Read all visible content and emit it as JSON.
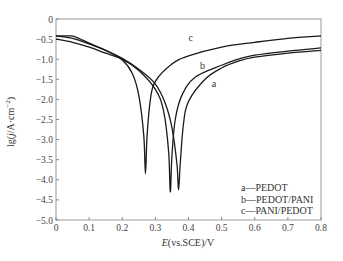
{
  "chart_data": {
    "type": "line",
    "title": "",
    "xlabel": "E(vs.SCE)/V",
    "ylabel": "lg(j/A·cm⁻²)",
    "xlim": [
      0,
      0.8
    ],
    "ylim": [
      -5.0,
      0
    ],
    "grid": false,
    "legend_position": "lower right (inside)",
    "x_ticks": [
      "0",
      "0.1",
      "0.2",
      "0.3",
      "0.4",
      "0.5",
      "0.6",
      "0.7",
      "0.8"
    ],
    "y_ticks": [
      "0",
      "-0.5",
      "-1.0",
      "-1.5",
      "-2.0",
      "-2.5",
      "-3.0",
      "-3.5",
      "-4.0",
      "-4.5",
      "-5.0"
    ],
    "series": [
      {
        "name": "a—PEDOT",
        "label": "a",
        "corrosion_potential_V": 0.37,
        "min_lg_j": -4.25,
        "points": [
          [
            0,
            -0.42
          ],
          [
            0.05,
            -0.48
          ],
          [
            0.1,
            -0.62
          ],
          [
            0.15,
            -0.78
          ],
          [
            0.2,
            -0.98
          ],
          [
            0.25,
            -1.25
          ],
          [
            0.3,
            -1.62
          ],
          [
            0.33,
            -2.1
          ],
          [
            0.35,
            -2.7
          ],
          [
            0.365,
            -3.6
          ],
          [
            0.37,
            -4.25
          ],
          [
            0.375,
            -3.6
          ],
          [
            0.385,
            -2.6
          ],
          [
            0.4,
            -2.05
          ],
          [
            0.45,
            -1.5
          ],
          [
            0.5,
            -1.22
          ],
          [
            0.55,
            -1.05
          ],
          [
            0.6,
            -0.95
          ],
          [
            0.7,
            -0.85
          ],
          [
            0.8,
            -0.78
          ]
        ]
      },
      {
        "name": "b—PEDOT/PANI",
        "label": "b",
        "corrosion_potential_V": 0.345,
        "min_lg_j": -4.3,
        "points": [
          [
            0,
            -0.5
          ],
          [
            0.05,
            -0.58
          ],
          [
            0.1,
            -0.7
          ],
          [
            0.15,
            -0.85
          ],
          [
            0.2,
            -1.0
          ],
          [
            0.25,
            -1.28
          ],
          [
            0.3,
            -1.75
          ],
          [
            0.325,
            -2.3
          ],
          [
            0.34,
            -3.3
          ],
          [
            0.345,
            -4.3
          ],
          [
            0.35,
            -3.4
          ],
          [
            0.36,
            -2.5
          ],
          [
            0.38,
            -1.9
          ],
          [
            0.42,
            -1.45
          ],
          [
            0.5,
            -1.15
          ],
          [
            0.55,
            -1.0
          ],
          [
            0.6,
            -0.9
          ],
          [
            0.7,
            -0.8
          ],
          [
            0.8,
            -0.72
          ]
        ]
      },
      {
        "name": "c—PANI/PEDOT",
        "label": "c",
        "corrosion_potential_V": 0.27,
        "min_lg_j": -3.85,
        "points": [
          [
            0,
            -0.42
          ],
          [
            0.04,
            -0.42
          ],
          [
            0.06,
            -0.45
          ],
          [
            0.1,
            -0.6
          ],
          [
            0.15,
            -0.78
          ],
          [
            0.2,
            -1.02
          ],
          [
            0.23,
            -1.35
          ],
          [
            0.25,
            -1.9
          ],
          [
            0.265,
            -2.9
          ],
          [
            0.27,
            -3.85
          ],
          [
            0.275,
            -2.9
          ],
          [
            0.285,
            -2.0
          ],
          [
            0.3,
            -1.55
          ],
          [
            0.35,
            -1.12
          ],
          [
            0.4,
            -0.92
          ],
          [
            0.5,
            -0.7
          ],
          [
            0.6,
            -0.58
          ],
          [
            0.7,
            -0.48
          ],
          [
            0.8,
            -0.42
          ]
        ]
      }
    ],
    "legend": [
      "a—PEDOT",
      "b—PEDOT/PANI",
      "c—PANI/PEDOT"
    ],
    "curve_labels": [
      "a",
      "b",
      "c"
    ]
  },
  "axes": {
    "xlabel_italic": "E",
    "xlabel_rest": "(vs.SCE)/V",
    "ylabel_prefix": "lg(",
    "ylabel_italic": "j",
    "ylabel_rest": "/A·cm",
    "ylabel_sup": "−2",
    "ylabel_suffix": ")"
  },
  "legend": {
    "a": "a—PEDOT",
    "b": "b—PEDOT/PANI",
    "c": "c—PANI/PEDOT"
  }
}
